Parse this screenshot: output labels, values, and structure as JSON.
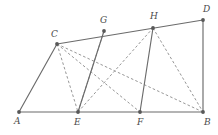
{
  "figure": {
    "width": 218,
    "height": 135,
    "background_color": "#ffffff",
    "solid_stroke_color": "#6b6b6b",
    "dashed_stroke_color": "#8a8a8a",
    "vertex_color": "#585858",
    "label_color": "#4a4a4a"
  },
  "vertices": [
    {
      "id": "A",
      "label": "A",
      "x": 19,
      "y": 112,
      "label_x": 14,
      "label_y": 117
    },
    {
      "id": "B",
      "label": "B",
      "x": 203,
      "y": 112,
      "label_x": 204,
      "label_y": 118
    },
    {
      "id": "C",
      "label": "C",
      "x": 57,
      "y": 44,
      "label_x": 51,
      "label_y": 30
    },
    {
      "id": "D",
      "label": "D",
      "x": 203,
      "y": 20,
      "label_x": 203,
      "label_y": 5
    },
    {
      "id": "E",
      "label": "E",
      "x": 78,
      "y": 112,
      "label_x": 74,
      "label_y": 118
    },
    {
      "id": "F",
      "label": "F",
      "x": 140,
      "y": 112,
      "label_x": 137,
      "label_y": 118
    },
    {
      "id": "G",
      "label": "G",
      "x": 104,
      "y": 31,
      "label_x": 100,
      "label_y": 16
    },
    {
      "id": "H",
      "label": "H",
      "x": 153,
      "y": 28,
      "label_x": 150,
      "label_y": 12
    }
  ],
  "solid_segments": [
    {
      "name": "segment-A-B",
      "from": "A",
      "to": "B"
    },
    {
      "name": "segment-A-C",
      "from": "A",
      "to": "C"
    },
    {
      "name": "segment-C-D",
      "from": "C",
      "to": "D"
    },
    {
      "name": "segment-D-B",
      "from": "D",
      "to": "B"
    },
    {
      "name": "segment-E-G",
      "from": "E",
      "to": "G"
    },
    {
      "name": "segment-F-H",
      "from": "F",
      "to": "H"
    }
  ],
  "dashed_segments": [
    {
      "name": "segment-C-E",
      "from": "C",
      "to": "E"
    },
    {
      "name": "segment-C-B",
      "from": "C",
      "to": "B"
    },
    {
      "name": "segment-E-H",
      "from": "E",
      "to": "H"
    },
    {
      "name": "segment-H-B",
      "from": "H",
      "to": "B"
    },
    {
      "name": "segment-C-F",
      "from": "C",
      "to": "F"
    },
    {
      "name": "segment-G-E",
      "from": "G",
      "to": "E"
    }
  ]
}
